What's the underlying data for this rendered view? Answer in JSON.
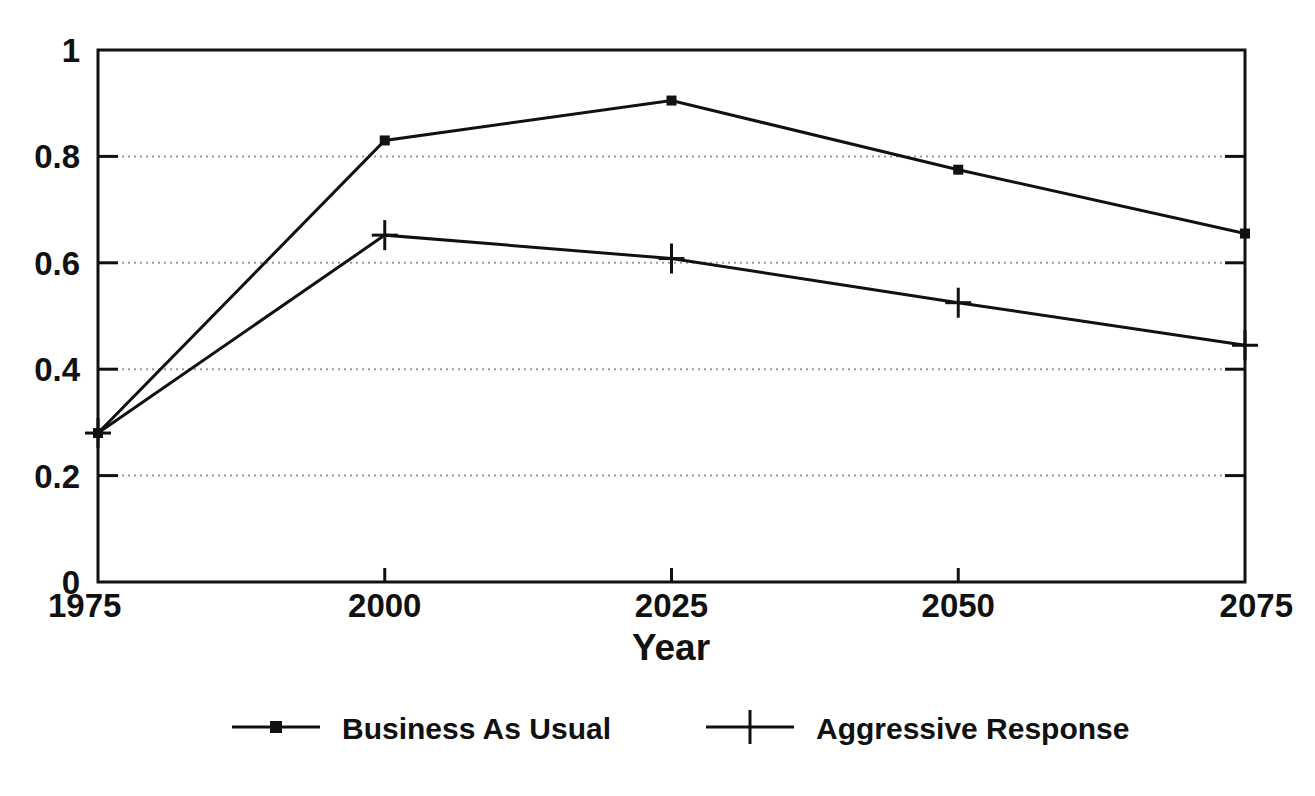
{
  "chart_data": {
    "type": "line",
    "title": "",
    "xlabel": "Year",
    "ylabel": "",
    "x": [
      1975,
      2000,
      2025,
      2050,
      2075
    ],
    "categories": [
      "1975",
      "2000",
      "2025",
      "2050",
      "2075"
    ],
    "xlim": [
      1975,
      2075
    ],
    "ylim": [
      0,
      1
    ],
    "xticks": [
      "1975",
      "2000",
      "2025",
      "2050",
      "2075"
    ],
    "yticks": [
      "0",
      "0.2",
      "0.4",
      "0.6",
      "0.8",
      "1"
    ],
    "grid": "horizontal-dotted",
    "legend_position": "bottom",
    "series": [
      {
        "name": "Business As Usual",
        "marker": "filled-square-dot",
        "values": [
          0.28,
          0.83,
          0.905,
          0.775,
          0.655
        ]
      },
      {
        "name": "Aggressive Response",
        "marker": "plus-cross",
        "values": [
          0.28,
          0.652,
          0.608,
          0.525,
          0.445
        ]
      }
    ]
  },
  "axes": {
    "y_tick_labels": [
      "1",
      "0.8",
      "0.6",
      "0.4",
      "0.2",
      "0"
    ],
    "y_tick_values": [
      1,
      0.8,
      0.6,
      0.4,
      0.2,
      0
    ],
    "x_tick_labels": [
      "1975",
      "2000",
      "2025",
      "2050",
      "2075"
    ],
    "x_axis_title": "Year"
  },
  "legend": {
    "items": [
      {
        "label": "Business As Usual",
        "marker": "dot-marker"
      },
      {
        "label": "Aggressive Response",
        "marker": "cross-marker"
      }
    ]
  },
  "colors": {
    "ink": "#111111",
    "grid": "#9a9a9a",
    "background": "#ffffff"
  }
}
